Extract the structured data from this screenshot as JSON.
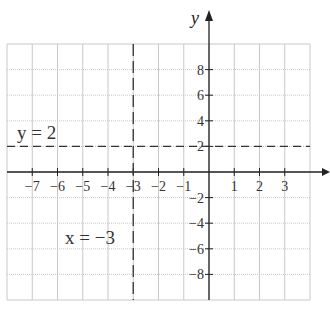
{
  "chart_data": {
    "type": "line",
    "title": "",
    "xlabel": "x",
    "ylabel": "y",
    "xlim": [
      -8,
      4
    ],
    "ylim": [
      -10,
      10
    ],
    "x_step": 1,
    "y_step": 2,
    "grid": true,
    "x_tick_labels": [
      "-7",
      "-6",
      "-5",
      "-4",
      "-3",
      "-2",
      "-1",
      "1",
      "2",
      "3"
    ],
    "x_ticks": [
      -7,
      -6,
      -5,
      -4,
      -3,
      -2,
      -1,
      1,
      2,
      3
    ],
    "y_tick_labels": [
      "8",
      "6",
      "4",
      "2",
      "-2",
      "-4",
      "-6",
      "-8"
    ],
    "y_ticks": [
      8,
      6,
      4,
      2,
      -2,
      -4,
      -6,
      -8
    ],
    "series": [
      {
        "name": "y = 2",
        "kind": "horizontal",
        "value": 2,
        "style": "dashed"
      },
      {
        "name": "x = -3",
        "kind": "vertical",
        "value": -3,
        "style": "dashed"
      }
    ],
    "annotations": [
      {
        "text": "y = 2",
        "x": -7.3,
        "y": 2.8
      },
      {
        "text": "x = −3",
        "x": -5.7,
        "y": -5
      }
    ]
  },
  "labels": {
    "y_axis": "y",
    "eq_horizontal": "y = 2",
    "eq_vertical": "x = −3"
  },
  "colors": {
    "grid": "#c8c8c8",
    "axis": "#222222",
    "dash": "#333333"
  }
}
